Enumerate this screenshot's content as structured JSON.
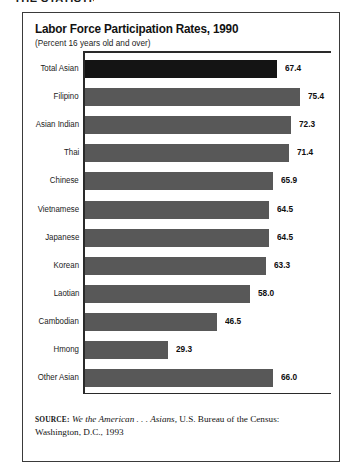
{
  "page": {
    "cut_off_header": "THE STATISTIC"
  },
  "figure": {
    "title": "Labor Force Participation Rates, 1990",
    "subtitle": "(Percent 16 years old and over)",
    "source": {
      "label": "SOURCE:",
      "italic_title": "We the American . . . Asians,",
      "rest": " U.S. Bureau of the Census: Washington, D.C., 1993"
    }
  },
  "colors": {
    "bar_gray": "#585858",
    "bar_highlight": "#141414",
    "frame": "#3a3a3a",
    "text": "#151515"
  },
  "chart_data": {
    "type": "bar",
    "orientation": "horizontal",
    "title": "Labor Force Participation Rates, 1990",
    "subtitle": "(Percent 16 years old and over)",
    "xlabel": "",
    "ylabel": "",
    "xlim": [
      0,
      80
    ],
    "grid": false,
    "legend": false,
    "value_label_format": "one-decimal",
    "highlight_category": "Total Asian",
    "categories": [
      "Total Asian",
      "Filipino",
      "Asian Indian",
      "Thai",
      "Chinese",
      "Vietnamese",
      "Japanese",
      "Korean",
      "Laotian",
      "Cambodian",
      "Hmong",
      "Other Asian"
    ],
    "values": [
      67.4,
      75.4,
      72.3,
      71.4,
      65.9,
      64.5,
      64.5,
      63.3,
      58.0,
      46.5,
      29.3,
      66.0
    ],
    "value_labels": [
      "67.4",
      "75.4",
      "72.3",
      "71.4",
      "65.9",
      "64.5",
      "64.5",
      "63.3",
      "58.0",
      "46.5",
      "29.3",
      "66.0"
    ]
  }
}
